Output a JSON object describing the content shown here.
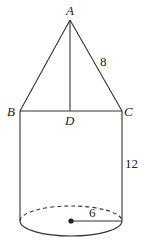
{
  "diagram": {
    "type": "geometry-solid",
    "stroke_color": "#333333",
    "points": {
      "A": {
        "label": "A",
        "x": 70,
        "y": 20
      },
      "B": {
        "label": "B",
        "x": 20,
        "y": 111
      },
      "C": {
        "label": "C",
        "x": 122,
        "y": 111
      },
      "D": {
        "label": "D",
        "x": 70,
        "y": 111
      }
    },
    "measurements": {
      "slant_height": "8",
      "cylinder_height": "12",
      "radius": "6"
    }
  }
}
